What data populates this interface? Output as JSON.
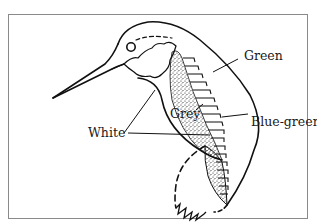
{
  "figure": {
    "labels": {
      "green": "Green",
      "grey": "Grey",
      "white": "White",
      "blue_green": "Blue-green"
    }
  },
  "colors": {
    "line": "#111111",
    "frame": "#8a8a8a",
    "background": "#ffffff"
  }
}
